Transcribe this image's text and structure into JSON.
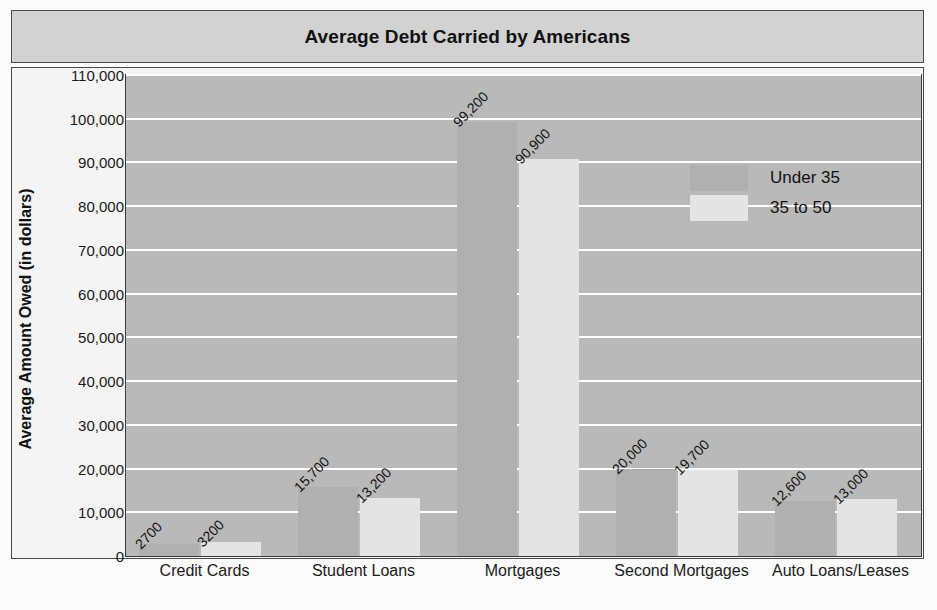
{
  "chart_data": {
    "type": "bar",
    "title": "Average Debt Carried by Americans",
    "xlabel": "",
    "ylabel": "Average Amount Owed (in dollars)",
    "categories": [
      "Credit Cards",
      "Student Loans",
      "Mortgages",
      "Second Mortgages",
      "Auto Loans/Leases"
    ],
    "series": [
      {
        "name": "Under 35",
        "values": [
          2700,
          15700,
          99200,
          20000,
          12600
        ],
        "color": "#b0b0b0"
      },
      {
        "name": "35 to 50",
        "values": [
          3200,
          13200,
          90900,
          19700,
          13000
        ],
        "color": "#e4e4e4"
      }
    ],
    "value_labels": [
      [
        "2700",
        "15,700",
        "99,200",
        "20,000",
        "12,600"
      ],
      [
        "3200",
        "13,200",
        "90,900",
        "19,700",
        "13,000"
      ]
    ],
    "ylim": [
      0,
      110000
    ],
    "ytick_values": [
      0,
      10000,
      20000,
      30000,
      40000,
      50000,
      60000,
      70000,
      80000,
      90000,
      100000,
      110000
    ],
    "ytick_labels": [
      "0",
      "10,000",
      "20,000",
      "30,000",
      "40,000",
      "50,000",
      "60,000",
      "70,000",
      "80,000",
      "90,000",
      "100,000",
      "110,000"
    ],
    "grid": true,
    "legend_position": "upper right",
    "plot_background": "#b9b9b9",
    "gridline_color": "#ffffff",
    "title_band_color": "#d2d2d2",
    "frame_color": "#4a4a4a"
  }
}
